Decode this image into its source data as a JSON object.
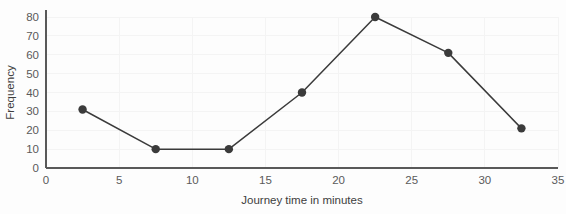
{
  "chart_data": {
    "type": "line",
    "title": "",
    "xlabel": "Journey time in minutes",
    "ylabel": "Frequency",
    "x": [
      2.5,
      7.5,
      12.5,
      17.5,
      22.5,
      27.5,
      32.5
    ],
    "values": [
      31,
      10,
      10,
      40,
      80,
      61,
      21
    ],
    "series": [
      {
        "name": "Frequency",
        "values": [
          31,
          10,
          10,
          40,
          80,
          61,
          21
        ]
      }
    ],
    "xlim": [
      0,
      35
    ],
    "ylim": [
      0,
      80
    ],
    "xticks": [
      0,
      5,
      10,
      15,
      20,
      25,
      30,
      35
    ],
    "yticks": [
      0,
      10,
      20,
      30,
      40,
      50,
      60,
      70,
      80
    ],
    "xtick_labels": [
      "0",
      "5",
      "10",
      "15",
      "20",
      "25",
      "30",
      "35"
    ],
    "ytick_labels": [
      "0",
      "10",
      "20",
      "30",
      "40",
      "50",
      "60",
      "70",
      "80"
    ],
    "grid": true,
    "legend": false,
    "marker": "circle",
    "line_color": "#3b3b3b",
    "marker_color": "#3b3b3b",
    "grid_color": "#f4f4f4",
    "axis_color": "#595959",
    "background_color": "#fdfdfd"
  }
}
